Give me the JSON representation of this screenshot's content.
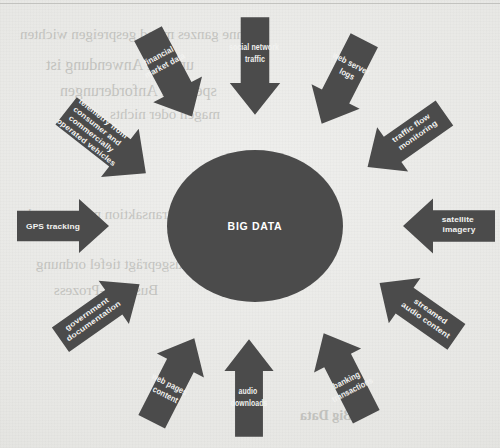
{
  "page": {
    "background_color": "#e7e7e4",
    "ink_color": "#4b4b4b",
    "label_color": "#f2f2f0"
  },
  "figure": {
    "hub_label": "BIG DATA",
    "sources": [
      {
        "id": "financial-market-data",
        "lines": [
          "financial",
          "market data"
        ],
        "direction": "down-right"
      },
      {
        "id": "social-network-traffic",
        "lines": [
          "social network",
          "traffic"
        ],
        "direction": "down"
      },
      {
        "id": "web-server-logs",
        "lines": [
          "web server",
          "logs"
        ],
        "direction": "down-left"
      },
      {
        "id": "traffic-flow-monitoring",
        "lines": [
          "traffic flow",
          "monitoring"
        ],
        "direction": "down-left"
      },
      {
        "id": "satellite-imagery",
        "lines": [
          "satellite",
          "imagery"
        ],
        "direction": "left"
      },
      {
        "id": "streamed-audio-content",
        "lines": [
          "streamed",
          "audio content"
        ],
        "direction": "up-left"
      },
      {
        "id": "banking-transactions",
        "lines": [
          "banking",
          "transactions"
        ],
        "direction": "up-left"
      },
      {
        "id": "audio-downloads",
        "lines": [
          "audio",
          "downloads"
        ],
        "direction": "up"
      },
      {
        "id": "web-pages-content",
        "lines": [
          "web pages",
          "content"
        ],
        "direction": "up-right"
      },
      {
        "id": "government-documentation",
        "lines": [
          "government",
          "documentation"
        ],
        "direction": "up-right"
      },
      {
        "id": "gps-tracking",
        "lines": [
          "GPS tracking"
        ],
        "direction": "right"
      },
      {
        "id": "telemetry-vehicles",
        "lines": [
          "telemetry from",
          "consumer and",
          "commercially",
          "operated vehicles"
        ],
        "direction": "down-right"
      }
    ]
  },
  "showthrough": {
    "lines": [
      "6 ohne ganzes mond gespreigen wichten",
      "und die Anwendung ist",
      "spezielle Anforderungen",
      "magen oder nichts",
      "transaktion mitgen sand",
      "ausgeprägt tiefel ordnung",
      "Business-Prozess",
      "Big Data"
    ]
  }
}
